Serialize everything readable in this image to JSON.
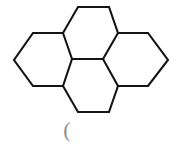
{
  "canvas": {
    "width": 190,
    "height": 150,
    "background_color": "#ffffff"
  },
  "figure": {
    "kind": "chemical-structure-skeletal-diagram",
    "line_color": "#141414",
    "line_width": 2.1,
    "ring_count": 4
  },
  "annotation": {
    "paren_glyph": "(",
    "color": "#8d8d8d"
  },
  "geometry": {
    "hexagons": [
      {
        "name": "top-ring",
        "points": "63,33 78,7 109,7 118,33 103,59 72,59"
      },
      {
        "name": "left-ring",
        "points": "33,33 63,33 72,59 63,86 33,86 14,60"
      },
      {
        "name": "right-ring",
        "points": "118,33 148,33 168,60 148,86 118,86 103,59"
      },
      {
        "name": "bottom-ring",
        "points": "72,59 103,59 118,86 109,112 78,112 63,86"
      }
    ],
    "outline_path": "M 33,33 L 63,33 L 78,7 L 109,7 L 118,33 L 148,33 L 168,60 L 148,86 L 118,86 L 109,112 L 78,112 L 63,86 L 33,86 L 14,60 Z",
    "inner_bonds": [
      "M 63,33 L 72,59",
      "M 118,33 L 103,59",
      "M 72,59 L 103,59",
      "M 72,59 L 63,86",
      "M 103,59 L 118,86"
    ]
  }
}
